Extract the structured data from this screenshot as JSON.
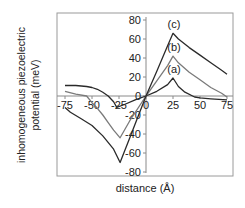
{
  "chart_data": {
    "type": "line",
    "title": "",
    "xlabel": "distance (Å)",
    "ylabel": "inhomogeneous piezoelectric potential (meV)",
    "ylabel_lines": [
      "inhomogeneous piezoelectric",
      "potential (meV)"
    ],
    "xlim": [
      -75,
      75
    ],
    "ylim": [
      -80,
      80
    ],
    "x_ticks": [
      -75,
      -50,
      -25,
      0,
      25,
      50,
      75
    ],
    "y_ticks": [
      -80,
      -60,
      -40,
      -20,
      0,
      20,
      40,
      60,
      80
    ],
    "grid": false,
    "legend": "inline labels near peaks",
    "series": [
      {
        "name": "(a)",
        "color": "#2a2a2a",
        "x": [
          -75,
          -65,
          -55,
          -50,
          -45,
          -40,
          -35,
          -30,
          -27,
          -20,
          -10,
          0,
          10,
          20,
          25,
          30,
          36,
          45,
          50,
          60,
          75
        ],
        "y": [
          11,
          11,
          10,
          9,
          7,
          4,
          0,
          -6,
          -12,
          -9,
          -4,
          0,
          5,
          12,
          19,
          10,
          4,
          -1,
          -2,
          -3,
          -4
        ]
      },
      {
        "name": "(b)",
        "color": "#7a7a7a",
        "x": [
          -75,
          -65,
          -55,
          -50,
          -45,
          -40,
          -35,
          -30,
          -24,
          -15,
          0,
          10,
          20,
          25,
          30,
          40,
          50,
          60,
          70,
          75
        ],
        "y": [
          5,
          2,
          0,
          -7,
          -13,
          -20,
          -28,
          -36,
          -44,
          -26,
          0,
          16,
          32,
          42,
          35,
          25,
          17,
          9,
          3,
          -1
        ]
      },
      {
        "name": "(c)",
        "color": "#2a2a2a",
        "x": [
          -75,
          -70,
          -60,
          -50,
          -40,
          -30,
          -24,
          -15,
          0,
          10,
          20,
          25,
          30,
          40,
          50,
          60,
          70,
          75
        ],
        "y": [
          -12,
          -17,
          -24,
          -31,
          -42,
          -56,
          -70,
          -44,
          0,
          26,
          53,
          66,
          60,
          51,
          43,
          35,
          27,
          23
        ]
      }
    ]
  }
}
